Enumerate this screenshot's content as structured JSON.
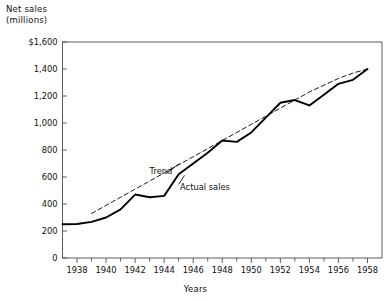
{
  "chart_data": {
    "type": "line",
    "title": "",
    "ylabel": "Net sales\n(millions)",
    "xlabel": "Years",
    "ylim": [
      0,
      1600
    ],
    "xlim": [
      1937,
      1959
    ],
    "grid": false,
    "legend_position": "inline-annotation",
    "y_tick_labels": [
      "$1,600",
      "1,400",
      "1,200",
      "1,000",
      "800",
      "600",
      "400",
      "200",
      "0"
    ],
    "y_tick_values": [
      1600,
      1400,
      1200,
      1000,
      800,
      600,
      400,
      200,
      0
    ],
    "x_tick_labels": [
      "1938",
      "1940",
      "1942",
      "1944",
      "1946",
      "1948",
      "1950",
      "1952",
      "1954",
      "1956",
      "1958"
    ],
    "x_tick_values": [
      1938,
      1940,
      1942,
      1944,
      1946,
      1948,
      1950,
      1952,
      1954,
      1956,
      1958
    ],
    "x_minor_ticks": [
      1937,
      1939,
      1941,
      1943,
      1945,
      1947,
      1949,
      1951,
      1953,
      1955,
      1957,
      1959
    ],
    "annotations": [
      {
        "text": "Trend",
        "x": 1943.0,
        "y": 640
      },
      {
        "text": "Actual sales",
        "x": 1945.1,
        "y": 520
      }
    ],
    "x": [
      1937,
      1938,
      1939,
      1940,
      1941,
      1942,
      1943,
      1944,
      1945,
      1946,
      1947,
      1948,
      1949,
      1950,
      1951,
      1952,
      1953,
      1954,
      1955,
      1956,
      1957,
      1958
    ],
    "series": [
      {
        "name": "Actual sales",
        "style": "solid",
        "color": "#000000",
        "values": [
          250,
          252,
          268,
          300,
          360,
          470,
          450,
          460,
          620,
          700,
          780,
          870,
          860,
          930,
          1040,
          1150,
          1170,
          1130,
          1210,
          1290,
          1320,
          1400
        ]
      },
      {
        "name": "Trend",
        "style": "dashed",
        "color": "#000000",
        "values": [
          null,
          null,
          330,
          390,
          450,
          510,
          570,
          630,
          690,
          750,
          810,
          870,
          930,
          990,
          1050,
          1110,
          1170,
          1230,
          1280,
          1330,
          1370,
          1400
        ]
      }
    ]
  },
  "axes": {
    "frame_color": "#4d4d4d"
  }
}
